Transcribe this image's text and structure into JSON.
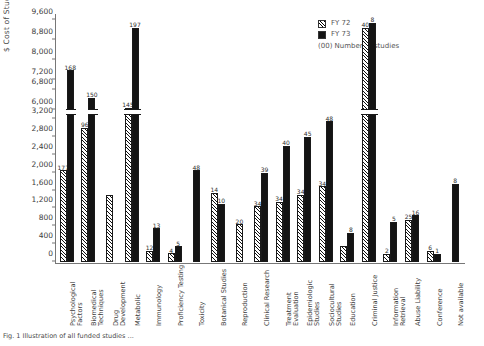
{
  "legend": {
    "items": [
      {
        "label": "FY 72",
        "pattern": "hatch"
      },
      {
        "label": "FY 73",
        "pattern": "solid"
      }
    ],
    "note": "(00)  Number of studies"
  },
  "caption": "Fig. 1  Illustration of all funded studies ...",
  "chart_data": {
    "type": "bar",
    "title": "",
    "xlabel": "",
    "ylabel": "$ Cost of Studies (Thousands)",
    "ylim": [
      0,
      9600
    ],
    "axis_break": {
      "below": 3200,
      "above": 6000
    },
    "yticks": [
      "0",
      "400",
      "800",
      "1,200",
      "1,600",
      "2,000",
      "2,400",
      "2,800",
      "3,200",
      "6,000",
      "6,800",
      "7,200",
      "8,000",
      "8,800",
      "9,600"
    ],
    "grid": false,
    "legend_position": "top-right",
    "categories": [
      "Psychological Factors",
      "Biomedical Techniques",
      "Drug Development",
      "Metabolic",
      "Immunology",
      "Proficiency Testing",
      "Toxicity",
      "Botanical Studies",
      "Reproduction",
      "Clinical Research",
      "Treatment Evaluation",
      "Epidemiologic Studies",
      "Sociocultural Studies",
      "Education",
      "Criminal Justice",
      "Information Retrieval",
      "Abuse Liability",
      "Conference",
      "Not available"
    ],
    "series": [
      {
        "name": "FY 72",
        "pattern": "hatch",
        "values": [
          2050,
          3000,
          1500,
          6100,
          250,
          200,
          0,
          1550,
          850,
          1250,
          1350,
          1500,
          1700,
          350,
          9300,
          180,
          950,
          250,
          0
        ],
        "counts": [
          "177",
          "96",
          "",
          "145",
          "12",
          "4",
          "",
          "14",
          "20",
          "34",
          "34",
          "34",
          "34",
          "",
          "40",
          "2",
          "25",
          "6",
          ""
        ]
      },
      {
        "name": "FY 73",
        "pattern": "solid",
        "values": [
          7600,
          6500,
          0,
          9300,
          750,
          350,
          2050,
          1300,
          0,
          2000,
          2600,
          2800,
          3150,
          650,
          9500,
          900,
          1050,
          180,
          1750
        ],
        "counts": [
          "168",
          "150",
          "32",
          "197",
          "13",
          "5",
          "48",
          "10",
          "",
          "39",
          "40",
          "45",
          "48",
          "8",
          "8",
          "5",
          "16",
          "1",
          "8"
        ]
      }
    ],
    "group_notes": {
      "drug_development_count": "32",
      "toxicity_count": "48"
    }
  }
}
